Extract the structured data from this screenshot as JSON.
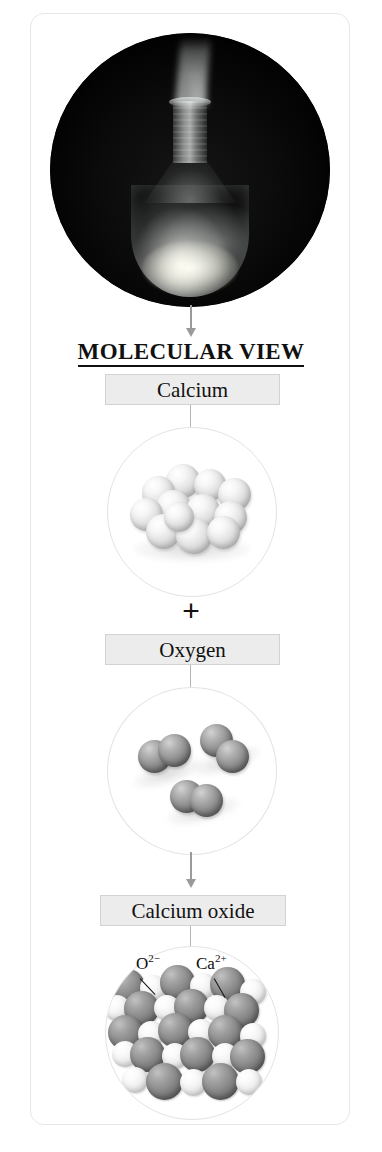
{
  "figure": {
    "credit": "© Cengage Learning",
    "heading": "MOLECULAR VIEW",
    "plus": "+",
    "photo": {
      "alt_description": "Round-bottom flask containing burning calcium metal emitting white smoke against a black background",
      "icon": "flask-photograph"
    },
    "steps": [
      {
        "label": "Calcium",
        "species": "Ca",
        "representation": "cluster of metallic calcium atoms",
        "sphere_count": 12,
        "sphere_color": "#eeeeee"
      },
      {
        "label": "Oxygen",
        "species": "O2",
        "representation": "three diatomic oxygen molecules",
        "molecule_count": 3,
        "sphere_color": "#8f8f8f"
      },
      {
        "label": "Calcium oxide",
        "species": "CaO",
        "representation": "ionic lattice of alternating calcium and oxide ions",
        "sphere_color_anion": "#848484",
        "sphere_color_cation": "#ededed"
      }
    ],
    "ion_labels": [
      {
        "text": "O",
        "charge": "2−",
        "full": "O2−",
        "points_to": "dark-sphere"
      },
      {
        "text": "Ca",
        "charge": "2+",
        "full": "Ca2+",
        "points_to": "light-sphere"
      }
    ],
    "arrows": [
      {
        "name": "photo-to-molecular-view",
        "direction": "down"
      },
      {
        "name": "oxygen-to-calcium-oxide",
        "direction": "down"
      }
    ],
    "colors": {
      "label_box_fill": "#ececec",
      "label_box_border": "#d2d2d2",
      "frame_border": "#e7e7e7",
      "arrow": "#9a9a9a",
      "text": "#111111"
    }
  }
}
